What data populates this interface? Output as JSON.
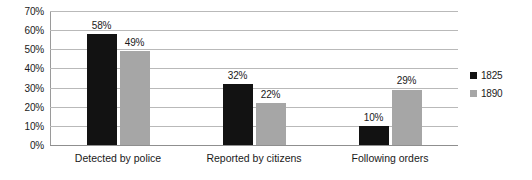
{
  "chart_data": {
    "type": "bar",
    "title": "",
    "xlabel": "",
    "ylabel": "",
    "ylim": [
      0,
      70
    ],
    "y_tick_step": 10,
    "y_ticks": [
      "0%",
      "10%",
      "20%",
      "30%",
      "40%",
      "50%",
      "60%",
      "70%"
    ],
    "grid": true,
    "legend_position": "right",
    "value_suffix": "%",
    "categories": [
      "Detected by police",
      "Reported by citizens",
      "Following orders"
    ],
    "series": [
      {
        "name": "1825",
        "color": "#121212",
        "values": [
          58,
          32,
          10
        ],
        "labels": [
          "58%",
          "32%",
          "10%"
        ]
      },
      {
        "name": "1890",
        "color": "#a6a6a6",
        "values": [
          49,
          22,
          29
        ],
        "labels": [
          "49%",
          "22%",
          "29%"
        ]
      }
    ]
  },
  "legend": {
    "items": [
      {
        "label": "1825",
        "swatch_color": "#121212"
      },
      {
        "label": "1890",
        "swatch_color": "#a6a6a6"
      }
    ]
  },
  "colors": {
    "series_1825": "#121212",
    "series_1890": "#a6a6a6",
    "gridline": "#b9b9b9",
    "axis": "#8f8f8f",
    "text": "#1a1a1a",
    "background": "#ffffff"
  }
}
